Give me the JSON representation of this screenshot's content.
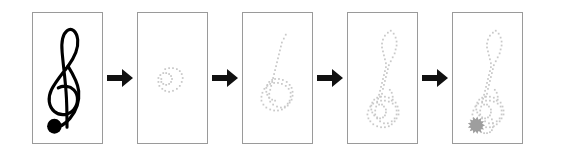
{
  "figure": {
    "title": "Progressive stipple reconstruction of a treble clef",
    "background_color": "#ffffff",
    "panel_border_color": "#9a9a9a",
    "arrow_color": "#111111",
    "stipple_color": "#c9c9c9",
    "reference_ink_color": "#000000",
    "blob_color": "#9e9e9e",
    "panel_count": 5,
    "arrow_count": 4,
    "panel_width_px": 71,
    "panel_height_px": 132
  },
  "arrows": [
    {
      "label": "step-arrow-1",
      "glyph": "right-arrow"
    },
    {
      "label": "step-arrow-2",
      "glyph": "right-arrow"
    },
    {
      "label": "step-arrow-3",
      "glyph": "right-arrow"
    },
    {
      "label": "step-arrow-4",
      "glyph": "right-arrow"
    }
  ],
  "panels": [
    {
      "id": "panel-1",
      "name": "reference-treble-clef",
      "kind": "reference",
      "subject": "treble-clef",
      "stipple_count": 0,
      "has_note_head_blob": false,
      "description": "Solid black treble clef reference glyph with filled round note head at base"
    },
    {
      "id": "panel-2",
      "name": "stipple-stage-1",
      "kind": "stipple",
      "subject": "treble-clef",
      "stipple_count": 29,
      "has_note_head_blob": false,
      "description": "Earliest stipple stage: only the small inner spiral loop is present"
    },
    {
      "id": "panel-3",
      "name": "stipple-stage-2",
      "kind": "stipple",
      "subject": "treble-clef",
      "stipple_count": 64,
      "has_note_head_blob": false,
      "description": "Lower bowl loop plus rising stem curve of the clef"
    },
    {
      "id": "panel-4",
      "name": "stipple-stage-3",
      "kind": "stipple",
      "subject": "treble-clef",
      "stipple_count": 96,
      "has_note_head_blob": false,
      "description": "Full clef outline including the upper teardrop loop"
    },
    {
      "id": "panel-5",
      "name": "stipple-stage-4-final",
      "kind": "stipple",
      "subject": "treble-clef",
      "stipple_count": 104,
      "has_note_head_blob": true,
      "description": "Complete stippled clef with filled gray note-head blob at the base"
    }
  ],
  "chart_data": {
    "type": "scatter",
    "title": "Progressive stipple reconstruction of a treble clef",
    "xlabel": "",
    "ylabel": "",
    "grid": false,
    "legend": "none",
    "xlim": [
      0,
      71
    ],
    "ylim": [
      0,
      132
    ],
    "series": [
      {
        "name": "panel-2-stipple",
        "marker": "square-dot",
        "color": "#c9c9c9",
        "points": [
          [
            28,
            57
          ],
          [
            32,
            56
          ],
          [
            36,
            56
          ],
          [
            40,
            57
          ],
          [
            43,
            59
          ],
          [
            45,
            62
          ],
          [
            46,
            66
          ],
          [
            45,
            70
          ],
          [
            43,
            74
          ],
          [
            40,
            77
          ],
          [
            36,
            79
          ],
          [
            32,
            80
          ],
          [
            28,
            79
          ],
          [
            25,
            77
          ],
          [
            22,
            74
          ],
          [
            21,
            70
          ],
          [
            21,
            66
          ],
          [
            23,
            63
          ],
          [
            26,
            61
          ],
          [
            29,
            61
          ],
          [
            32,
            62
          ],
          [
            34,
            64
          ],
          [
            35,
            67
          ],
          [
            34,
            70
          ],
          [
            32,
            72
          ],
          [
            29,
            73
          ],
          [
            26,
            72
          ],
          [
            24,
            70
          ],
          [
            24,
            67
          ]
        ]
      },
      {
        "name": "panel-3-stipple",
        "marker": "square-dot",
        "color": "#c9c9c9",
        "points": [
          [
            44,
            22
          ],
          [
            42,
            26
          ],
          [
            40,
            30
          ],
          [
            39,
            34
          ],
          [
            38,
            38
          ],
          [
            37,
            42
          ],
          [
            36,
            46
          ],
          [
            35,
            50
          ],
          [
            34,
            54
          ],
          [
            33,
            58
          ],
          [
            32,
            62
          ],
          [
            31,
            66
          ],
          [
            30,
            70
          ],
          [
            29,
            74
          ],
          [
            28,
            78
          ],
          [
            27,
            82
          ],
          [
            27,
            86
          ],
          [
            28,
            90
          ],
          [
            31,
            93
          ],
          [
            35,
            95
          ],
          [
            39,
            96
          ],
          [
            43,
            95
          ],
          [
            46,
            92
          ],
          [
            48,
            89
          ],
          [
            49,
            85
          ],
          [
            49,
            81
          ],
          [
            47,
            77
          ],
          [
            44,
            74
          ],
          [
            40,
            72
          ],
          [
            36,
            71
          ],
          [
            32,
            71
          ],
          [
            28,
            72
          ],
          [
            25,
            74
          ],
          [
            22,
            77
          ],
          [
            20,
            81
          ],
          [
            19,
            85
          ],
          [
            19,
            89
          ],
          [
            21,
            93
          ],
          [
            24,
            96
          ],
          [
            28,
            98
          ],
          [
            32,
            99
          ],
          [
            36,
            99
          ],
          [
            40,
            98
          ],
          [
            43,
            96
          ],
          [
            46,
            94
          ],
          [
            48,
            91
          ],
          [
            50,
            88
          ],
          [
            51,
            84
          ],
          [
            51,
            80
          ],
          [
            50,
            76
          ],
          [
            48,
            73
          ],
          [
            45,
            70
          ],
          [
            41,
            68
          ],
          [
            37,
            67
          ],
          [
            33,
            67
          ],
          [
            30,
            68
          ],
          [
            27,
            70
          ],
          [
            25,
            73
          ],
          [
            24,
            76
          ],
          [
            24,
            80
          ],
          [
            25,
            83
          ],
          [
            27,
            86
          ],
          [
            30,
            88
          ],
          [
            33,
            89
          ]
        ]
      },
      {
        "name": "panel-4-stipple",
        "marker": "square-dot",
        "color": "#c9c9c9",
        "points": [
          [
            44,
            18
          ],
          [
            47,
            21
          ],
          [
            49,
            25
          ],
          [
            50,
            29
          ],
          [
            50,
            33
          ],
          [
            49,
            37
          ],
          [
            48,
            41
          ],
          [
            46,
            45
          ],
          [
            44,
            49
          ],
          [
            42,
            53
          ],
          [
            41,
            57
          ],
          [
            40,
            61
          ],
          [
            39,
            65
          ],
          [
            38,
            69
          ],
          [
            37,
            73
          ],
          [
            36,
            77
          ],
          [
            41,
            20
          ],
          [
            38,
            23
          ],
          [
            36,
            27
          ],
          [
            35,
            31
          ],
          [
            35,
            35
          ],
          [
            36,
            39
          ],
          [
            37,
            43
          ],
          [
            38,
            47
          ],
          [
            39,
            51
          ],
          [
            39,
            55
          ],
          [
            38,
            59
          ],
          [
            37,
            63
          ],
          [
            36,
            67
          ],
          [
            35,
            71
          ],
          [
            34,
            75
          ],
          [
            33,
            79
          ],
          [
            32,
            83
          ],
          [
            31,
            87
          ],
          [
            30,
            91
          ],
          [
            29,
            95
          ],
          [
            28,
            99
          ],
          [
            28,
            103
          ],
          [
            30,
            107
          ],
          [
            33,
            110
          ],
          [
            37,
            112
          ],
          [
            41,
            112
          ],
          [
            45,
            110
          ],
          [
            48,
            107
          ],
          [
            50,
            103
          ],
          [
            50,
            99
          ],
          [
            49,
            95
          ],
          [
            46,
            92
          ],
          [
            42,
            90
          ],
          [
            38,
            89
          ],
          [
            34,
            89
          ],
          [
            30,
            90
          ],
          [
            26,
            92
          ],
          [
            23,
            95
          ],
          [
            21,
            99
          ],
          [
            20,
            103
          ],
          [
            21,
            107
          ],
          [
            23,
            110
          ],
          [
            26,
            113
          ],
          [
            30,
            115
          ],
          [
            34,
            116
          ],
          [
            38,
            116
          ],
          [
            42,
            115
          ],
          [
            45,
            113
          ],
          [
            48,
            110
          ],
          [
            50,
            107
          ],
          [
            52,
            103
          ],
          [
            52,
            99
          ],
          [
            51,
            95
          ],
          [
            49,
            91
          ],
          [
            46,
            88
          ],
          [
            42,
            86
          ],
          [
            38,
            85
          ],
          [
            34,
            85
          ],
          [
            30,
            86
          ],
          [
            27,
            88
          ],
          [
            25,
            91
          ],
          [
            24,
            94
          ],
          [
            24,
            98
          ],
          [
            25,
            101
          ],
          [
            27,
            104
          ],
          [
            30,
            106
          ],
          [
            33,
            107
          ],
          [
            36,
            106
          ],
          [
            38,
            104
          ],
          [
            39,
            101
          ],
          [
            39,
            98
          ],
          [
            37,
            95
          ],
          [
            35,
            93
          ],
          [
            32,
            93
          ],
          [
            43,
            78
          ],
          [
            45,
            81
          ],
          [
            46,
            85
          ],
          [
            45,
            89
          ],
          [
            35,
            82
          ],
          [
            33,
            85
          ]
        ]
      },
      {
        "name": "panel-5-stipple",
        "marker": "square-dot",
        "color": "#c9c9c9",
        "points": [
          [
            44,
            18
          ],
          [
            47,
            21
          ],
          [
            49,
            25
          ],
          [
            50,
            29
          ],
          [
            50,
            33
          ],
          [
            49,
            37
          ],
          [
            48,
            41
          ],
          [
            46,
            45
          ],
          [
            44,
            49
          ],
          [
            42,
            53
          ],
          [
            41,
            57
          ],
          [
            40,
            61
          ],
          [
            39,
            65
          ],
          [
            38,
            69
          ],
          [
            37,
            73
          ],
          [
            36,
            77
          ],
          [
            41,
            20
          ],
          [
            38,
            23
          ],
          [
            36,
            27
          ],
          [
            35,
            31
          ],
          [
            35,
            35
          ],
          [
            36,
            39
          ],
          [
            37,
            43
          ],
          [
            38,
            47
          ],
          [
            39,
            51
          ],
          [
            39,
            55
          ],
          [
            38,
            59
          ],
          [
            37,
            63
          ],
          [
            36,
            67
          ],
          [
            35,
            71
          ],
          [
            34,
            75
          ],
          [
            33,
            79
          ],
          [
            32,
            83
          ],
          [
            31,
            87
          ],
          [
            30,
            91
          ],
          [
            29,
            95
          ],
          [
            28,
            99
          ],
          [
            28,
            103
          ],
          [
            30,
            107
          ],
          [
            33,
            110
          ],
          [
            37,
            112
          ],
          [
            41,
            112
          ],
          [
            45,
            110
          ],
          [
            48,
            107
          ],
          [
            50,
            103
          ],
          [
            50,
            99
          ],
          [
            49,
            95
          ],
          [
            46,
            92
          ],
          [
            42,
            90
          ],
          [
            38,
            89
          ],
          [
            34,
            89
          ],
          [
            30,
            90
          ],
          [
            26,
            92
          ],
          [
            23,
            95
          ],
          [
            21,
            99
          ],
          [
            20,
            103
          ],
          [
            21,
            107
          ],
          [
            23,
            110
          ],
          [
            26,
            113
          ],
          [
            30,
            115
          ],
          [
            34,
            116
          ],
          [
            38,
            116
          ],
          [
            42,
            115
          ],
          [
            45,
            113
          ],
          [
            48,
            110
          ],
          [
            50,
            107
          ],
          [
            52,
            103
          ],
          [
            52,
            99
          ],
          [
            51,
            95
          ],
          [
            49,
            91
          ],
          [
            46,
            88
          ],
          [
            42,
            86
          ],
          [
            38,
            85
          ],
          [
            34,
            85
          ],
          [
            30,
            86
          ],
          [
            27,
            88
          ],
          [
            25,
            91
          ],
          [
            24,
            94
          ],
          [
            24,
            98
          ],
          [
            25,
            101
          ],
          [
            27,
            104
          ],
          [
            30,
            106
          ],
          [
            33,
            107
          ],
          [
            36,
            106
          ],
          [
            38,
            104
          ],
          [
            39,
            101
          ],
          [
            39,
            98
          ],
          [
            37,
            95
          ],
          [
            35,
            93
          ],
          [
            32,
            93
          ],
          [
            43,
            78
          ],
          [
            45,
            81
          ],
          [
            46,
            85
          ],
          [
            45,
            89
          ],
          [
            35,
            82
          ],
          [
            33,
            85
          ],
          [
            40,
            108
          ],
          [
            41,
            112
          ],
          [
            41,
            116
          ],
          [
            40,
            119
          ],
          [
            38,
            121
          ],
          [
            35,
            122
          ],
          [
            32,
            122
          ],
          [
            29,
            121
          ]
        ]
      }
    ],
    "annotations": [
      {
        "name": "note-head-blob",
        "panel": "panel-5",
        "x": 24,
        "y": 114,
        "r": 9,
        "color": "#9e9e9e"
      }
    ]
  }
}
